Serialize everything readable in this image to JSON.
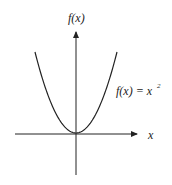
{
  "diagram": {
    "y_axis_label": "f(x)",
    "x_axis_label": "x",
    "curve_label": "f(x) = x",
    "curve_label_exponent": "2",
    "function": "x^2",
    "line_color": "#222222"
  }
}
